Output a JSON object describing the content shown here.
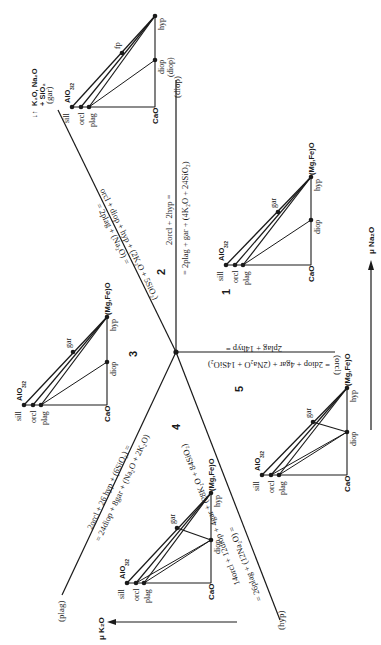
{
  "figure": {
    "type": "Schreinemakers net (chemical potential diagram)",
    "axes": {
      "horizontal": "μ K₂O",
      "vertical": "μ Na₂O"
    },
    "mobile_components_label": [
      "K₂O, Na₂O",
      "+ SiO₂"
    ],
    "invariant_point": "central node",
    "univariant_lines": [
      {
        "id": "gar",
        "absent_label": "(gar)",
        "reaction_line1": "orcl + diop + hyp + (2K₂O + 5SiO₂)",
        "reaction_line2": "= 2plag + (Na₂O) ="
      },
      {
        "id": "diop",
        "absent_label": "(diop)",
        "reaction_line1": "2orcl + 2hyp =",
        "reaction_line2": "= 2plag + gar + (4K₂O + 24SiO₂)"
      },
      {
        "id": "orcl",
        "absent_label": "(orcl)",
        "reaction_line1": "2plag + 14hyp =",
        "reaction_line2": "= 2diop + 4gar + (2Na₂O + 14SiO₂)"
      },
      {
        "id": "hyp",
        "absent_label": "(hyp)",
        "reaction_line1": "14orcl + 12diop + 4gar + (28K₂O + 84SiO₂)",
        "reaction_line2": "= 26plag + (12Na₂O) ="
      },
      {
        "id": "plag",
        "absent_label": "(plag)",
        "reaction_line1": "2orcl + 26 hyp + (6SiO₂) =",
        "reaction_line2": "= 24diop + 8gar + (Na₂O + 2K₂O)"
      }
    ],
    "fields": [
      "1",
      "2",
      "3",
      "4",
      "5"
    ],
    "triangles": [
      {
        "field": "2",
        "apex_top": "AlO3/2",
        "apex_right": "hyp",
        "corner": "CaO",
        "phases": [
          "sill",
          "orcl",
          "plag",
          "diop",
          "hyp",
          "fp"
        ]
      },
      {
        "field": "1",
        "apex_top": "AlO3/2",
        "apex_right": "(Mg,Fe)O",
        "corner": "CaO",
        "phases": [
          "sill",
          "orcl",
          "plag",
          "diop",
          "hyp",
          "gar"
        ]
      },
      {
        "field": "3",
        "apex_top": "AlO3/2",
        "apex_right": "(Mg,Fe)O",
        "corner": "CaO",
        "phases": [
          "sill",
          "orcl",
          "plag",
          "diop",
          "hyp",
          "gar"
        ]
      },
      {
        "field": "4",
        "apex_top": "AlO3/2",
        "apex_right": "(Mg,Fe)O",
        "corner": "CaO",
        "phases": [
          "sill",
          "orcl",
          "plag",
          "diop",
          "hyp",
          "gar"
        ]
      },
      {
        "field": "5",
        "apex_top": "AlO3/2",
        "apex_right": "(Mg,Fe)O",
        "corner": "CaO",
        "phases": [
          "sill",
          "orcl",
          "plag",
          "diop",
          "hyp",
          "gar"
        ]
      }
    ],
    "labels": {
      "alo": "AlO",
      "alo_sub": "3/2",
      "mgfeo": "(Mg,Fe)O",
      "cao": "CaO",
      "sill": "sill",
      "orcl": "orcl",
      "plag": "plag",
      "diop": "diop",
      "hyp": "hyp",
      "gar": "gar",
      "fp": "fp"
    }
  }
}
